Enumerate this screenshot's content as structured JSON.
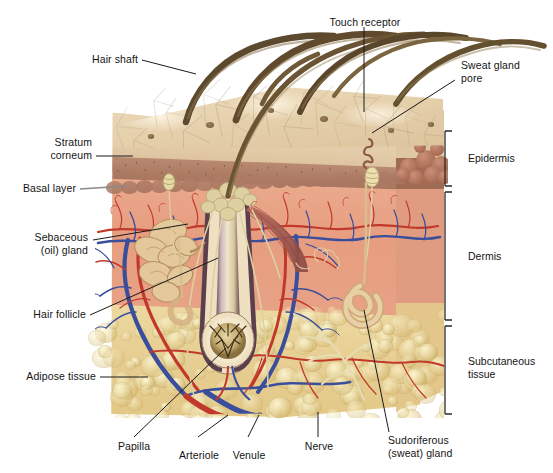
{
  "figure": {
    "type": "anatomical-illustration"
  },
  "labels": {
    "hair_shaft": "Hair shaft",
    "touch_receptor": "Touch receptor",
    "sweat_gland_pore": "Sweat gland\npore",
    "stratum_corneum": "Stratum\ncorneum",
    "basal_layer": "Basal layer",
    "sebaceous_gland": "Sebaceous\n(oil) gland",
    "hair_follicle": "Hair follicle",
    "adipose_tissue": "Adipose tissue",
    "papilla": "Papilla",
    "arteriole": "Arteriole",
    "venule": "Venule",
    "nerve": "Nerve",
    "sudoriferous_gland": "Sudoriferous\n(sweat) gland"
  },
  "brackets": {
    "epidermis": "Epidermis",
    "dermis": "Dermis",
    "subcutaneous": "Subcutaneous\ntissue"
  },
  "colors": {
    "background": "#ffffff",
    "text": "#141414",
    "leader_line": "#1a1a1a",
    "stratum_corneum": "#e6d2ae",
    "granular_layer": "#ad7b63",
    "dermis": "#e79d80",
    "subcutaneous_fat": "#e7ce92",
    "artery_red": "#c0392b",
    "vein_blue": "#3b4e9b",
    "nerve_cream": "#e6d9a8",
    "hair_brown": "#6b5535",
    "gland_tan": "#d9b98a"
  }
}
